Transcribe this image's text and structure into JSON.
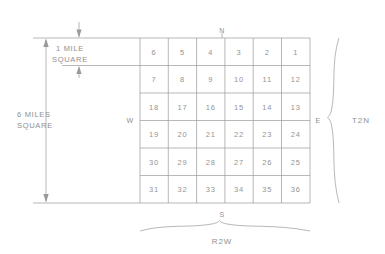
{
  "diagram": {
    "grid": {
      "rows": 6,
      "cols": 6,
      "sections": [
        [
          "6",
          "5",
          "4",
          "3",
          "2",
          "1"
        ],
        [
          "7",
          "8",
          "9",
          "10",
          "11",
          "12"
        ],
        [
          "18",
          "17",
          "16",
          "15",
          "14",
          "13"
        ],
        [
          "19",
          "20",
          "21",
          "22",
          "23",
          "24"
        ],
        [
          "30",
          "29",
          "28",
          "27",
          "26",
          "25"
        ],
        [
          "31",
          "32",
          "33",
          "34",
          "35",
          "36"
        ]
      ]
    },
    "compass": {
      "north": "N",
      "west": "W",
      "east": "E",
      "south": "S"
    },
    "dimensions": {
      "cell_label_line1": "1 MILE",
      "cell_label_line2": "SQUARE",
      "township_label_line1": "6 MILES",
      "township_label_line2": "SQUARE"
    },
    "labels": {
      "township": "T2N",
      "range": "R2W"
    },
    "colors": {
      "line": "#9a9a9a",
      "text": "#8f8f8f",
      "background": "#ffffff"
    }
  }
}
